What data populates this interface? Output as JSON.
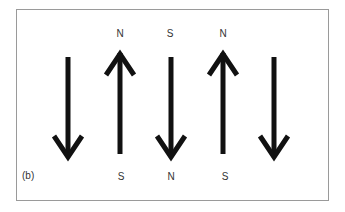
{
  "panel_label": "(b)",
  "arrows": [
    {
      "x": 68,
      "direction": "down",
      "top_label": "",
      "bottom_label": ""
    },
    {
      "x": 120,
      "direction": "up",
      "top_label": "N",
      "bottom_label": "S"
    },
    {
      "x": 171,
      "direction": "down",
      "top_label": "S",
      "bottom_label": "N"
    },
    {
      "x": 223,
      "direction": "up",
      "top_label": "N",
      "bottom_label": "S"
    },
    {
      "x": 274,
      "direction": "down",
      "top_label": "",
      "bottom_label": ""
    }
  ],
  "labels": {
    "a2_top": "N",
    "a2_bottom": "S",
    "a3_top": "S",
    "a3_bottom": "N",
    "a4_top": "N",
    "a4_bottom": "S"
  },
  "colors": {
    "arrow": "#111111",
    "border": "#9a9a9a",
    "text": "#333333"
  }
}
